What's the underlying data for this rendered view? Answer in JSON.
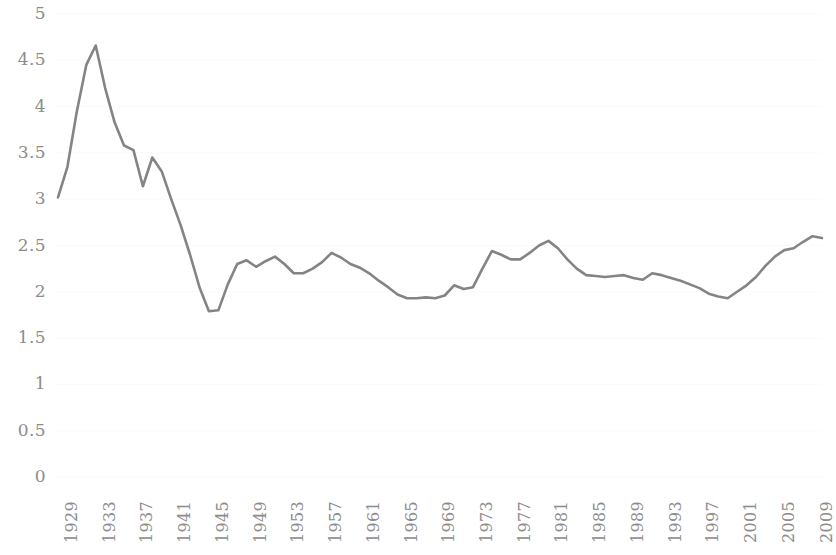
{
  "chart_data": {
    "type": "line",
    "title": "",
    "subtitle": "",
    "xlabel": "",
    "ylabel": "",
    "grid": true,
    "legend": "none",
    "xlim": [
      1929,
      2010
    ],
    "ylim": [
      0,
      5
    ],
    "y_ticks": [
      "5",
      "4.5",
      "4",
      "3.5",
      "3",
      "2.5",
      "2",
      "1.5",
      "1",
      "0.5",
      "0"
    ],
    "y_tick_values": [
      5,
      4.5,
      4,
      3.5,
      3,
      2.5,
      2,
      1.5,
      1,
      0.5,
      0
    ],
    "x_ticks": [
      "1929",
      "1933",
      "1937",
      "1941",
      "1945",
      "1949",
      "1953",
      "1957",
      "1961",
      "1965",
      "1969",
      "1973",
      "1977",
      "1981",
      "1985",
      "1989",
      "1993",
      "1997",
      "2001",
      "2005",
      "2009"
    ],
    "x_tick_values": [
      1929,
      1933,
      1937,
      1941,
      1945,
      1949,
      1953,
      1957,
      1961,
      1965,
      1969,
      1973,
      1977,
      1981,
      1985,
      1989,
      1993,
      1997,
      2001,
      2005,
      2009
    ],
    "x": [
      1929,
      1930,
      1931,
      1932,
      1933,
      1934,
      1935,
      1936,
      1937,
      1938,
      1939,
      1940,
      1941,
      1942,
      1943,
      1944,
      1945,
      1946,
      1947,
      1948,
      1949,
      1950,
      1951,
      1952,
      1953,
      1954,
      1955,
      1956,
      1957,
      1958,
      1959,
      1960,
      1961,
      1962,
      1963,
      1964,
      1965,
      1966,
      1967,
      1968,
      1969,
      1970,
      1971,
      1972,
      1973,
      1974,
      1975,
      1976,
      1977,
      1978,
      1979,
      1980,
      1981,
      1982,
      1983,
      1984,
      1985,
      1986,
      1987,
      1988,
      1989,
      1990,
      1991,
      1992,
      1993,
      1994,
      1995,
      1996,
      1997,
      1998,
      1999,
      2000,
      2001,
      2002,
      2003,
      2004,
      2005,
      2006,
      2007,
      2008,
      2009,
      2010
    ],
    "series": [
      {
        "name": "Series 1",
        "color": "#848484",
        "values": [
          3.02,
          3.35,
          3.95,
          4.45,
          4.66,
          4.2,
          3.83,
          3.58,
          3.53,
          3.14,
          3.45,
          3.3,
          3.0,
          2.72,
          2.4,
          2.05,
          1.79,
          1.8,
          2.08,
          2.3,
          2.34,
          2.27,
          2.33,
          2.38,
          2.3,
          2.2,
          2.2,
          2.25,
          2.32,
          2.42,
          2.37,
          2.3,
          2.26,
          2.2,
          2.12,
          2.05,
          1.97,
          1.93,
          1.93,
          1.94,
          1.93,
          1.96,
          2.07,
          2.03,
          2.05,
          2.25,
          2.44,
          2.4,
          2.35,
          2.35,
          2.42,
          2.5,
          2.55,
          2.47,
          2.35,
          2.25,
          2.18,
          2.17,
          2.16,
          2.17,
          2.18,
          2.15,
          2.13,
          2.2,
          2.18,
          2.15,
          2.12,
          2.08,
          2.04,
          1.98,
          1.95,
          1.93,
          2.0,
          2.07,
          2.16,
          2.28,
          2.38,
          2.45,
          2.47,
          2.54,
          2.6,
          2.58
        ]
      }
    ]
  },
  "axis": {
    "y_label_text": "",
    "x_label_text": ""
  }
}
